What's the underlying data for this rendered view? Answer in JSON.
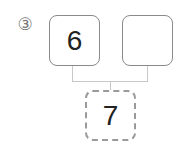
{
  "problem": {
    "label": "③",
    "top_left_value": "6",
    "top_right_value": "",
    "bottom_value": "7"
  }
}
